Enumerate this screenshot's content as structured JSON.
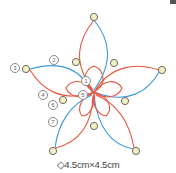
{
  "diagram": {
    "caption": "◇4.5cm×4.5cm",
    "colors": {
      "red_thread": "#e8553e",
      "blue_thread": "#3a9ad9",
      "ring_fill": "#f3f0c8",
      "ring_stroke": "#6b6b5a"
    },
    "labels": [
      {
        "id": "1",
        "text": "1",
        "x": 81,
        "y": 76
      },
      {
        "id": "2",
        "text": "2",
        "x": 49,
        "y": 55
      },
      {
        "id": "3",
        "text": "3",
        "x": 10,
        "y": 63
      },
      {
        "id": "4",
        "text": "4",
        "x": 38,
        "y": 90
      },
      {
        "id": "5",
        "text": "5",
        "x": 78,
        "y": 90
      },
      {
        "id": "6",
        "text": "6",
        "x": 48,
        "y": 100
      },
      {
        "id": "7",
        "text": "7",
        "x": 48,
        "y": 117
      }
    ],
    "outer_picots": [
      {
        "x": 94,
        "y": 17
      },
      {
        "x": 27,
        "y": 69
      },
      {
        "x": 162,
        "y": 70
      },
      {
        "x": 53,
        "y": 151
      },
      {
        "x": 136,
        "y": 151
      }
    ],
    "inner_picots": [
      {
        "x": 76,
        "y": 62
      },
      {
        "x": 114,
        "y": 63
      },
      {
        "x": 63,
        "y": 100
      },
      {
        "x": 125,
        "y": 101
      },
      {
        "x": 94,
        "y": 126
      }
    ]
  }
}
